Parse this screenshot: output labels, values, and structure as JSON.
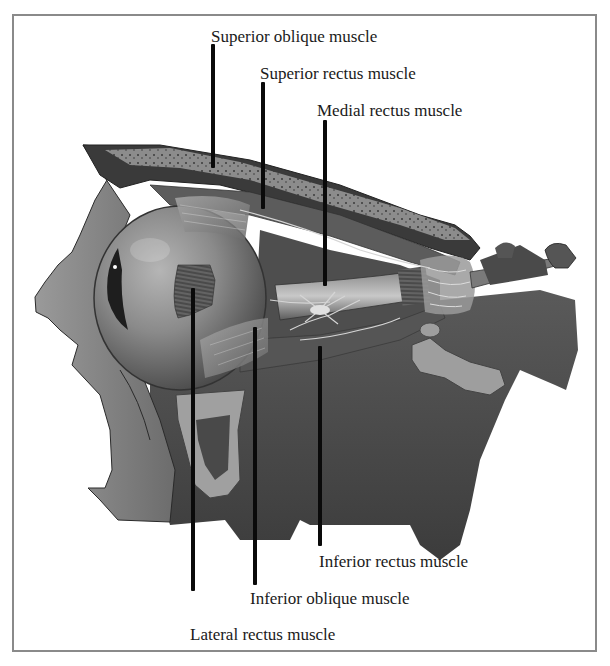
{
  "diagram": {
    "style": "grayscale anatomical illustration",
    "frame_color": "#8a8a8a",
    "leader_color": "#0a0a0a",
    "labels": [
      {
        "id": "superior-oblique",
        "text": "Superior oblique muscle"
      },
      {
        "id": "superior-rectus",
        "text": "Superior rectus muscle"
      },
      {
        "id": "medial-rectus",
        "text": "Medial rectus muscle"
      },
      {
        "id": "inferior-rectus",
        "text": "Inferior rectus muscle"
      },
      {
        "id": "inferior-oblique",
        "text": "Inferior oblique muscle"
      },
      {
        "id": "lateral-rectus",
        "text": "Lateral rectus muscle"
      }
    ]
  }
}
